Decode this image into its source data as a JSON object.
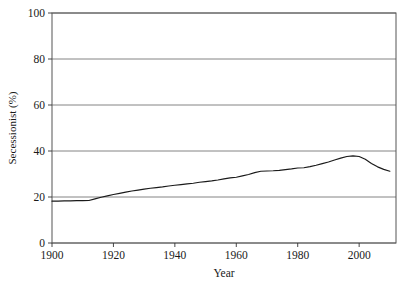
{
  "chart_data": {
    "type": "line",
    "title": "",
    "xlabel": "Year",
    "ylabel": "Secessionist (%)",
    "xlim": [
      1900,
      2012
    ],
    "ylim": [
      0,
      100
    ],
    "xticks": [
      1900,
      1920,
      1940,
      1960,
      1980,
      2000
    ],
    "xtick_labels": [
      "1900",
      "1920",
      "1940",
      "1960",
      "1980",
      "2000"
    ],
    "yticks": [
      0,
      20,
      40,
      60,
      80,
      100
    ],
    "ytick_labels": [
      "0",
      "20",
      "40",
      "60",
      "80",
      "100"
    ],
    "grid": "horizontal",
    "legend": "none",
    "line_color": "#1a1a1a",
    "frame_color": "#555555",
    "grid_color": "#777777",
    "background_color": "#ffffff",
    "series": [
      {
        "name": "Secessionist",
        "x": [
          1900,
          1902,
          1904,
          1906,
          1908,
          1910,
          1912,
          1914,
          1916,
          1918,
          1920,
          1922,
          1924,
          1926,
          1928,
          1930,
          1932,
          1934,
          1936,
          1938,
          1940,
          1942,
          1944,
          1946,
          1948,
          1950,
          1952,
          1954,
          1956,
          1958,
          1960,
          1962,
          1964,
          1966,
          1968,
          1970,
          1972,
          1974,
          1976,
          1978,
          1980,
          1982,
          1984,
          1986,
          1988,
          1990,
          1992,
          1994,
          1996,
          1998,
          2000,
          2002,
          2004,
          2006,
          2008,
          2010
        ],
        "y": [
          18.2,
          18.2,
          18.3,
          18.3,
          18.4,
          18.4,
          18.5,
          19.2,
          19.9,
          20.5,
          21.1,
          21.6,
          22.1,
          22.6,
          23.0,
          23.4,
          23.8,
          24.1,
          24.4,
          24.8,
          25.1,
          25.4,
          25.7,
          26.0,
          26.4,
          26.7,
          27.0,
          27.4,
          27.9,
          28.3,
          28.6,
          29.2,
          29.8,
          30.6,
          31.2,
          31.3,
          31.4,
          31.6,
          31.9,
          32.2,
          32.6,
          32.7,
          33.2,
          33.8,
          34.5,
          35.2,
          36.1,
          36.9,
          37.6,
          37.9,
          37.6,
          36.4,
          34.6,
          33.1,
          32.0,
          31.2
        ]
      }
    ]
  },
  "axes": {
    "ylabel": "Secessionist (%)",
    "xlabel": "Year"
  }
}
